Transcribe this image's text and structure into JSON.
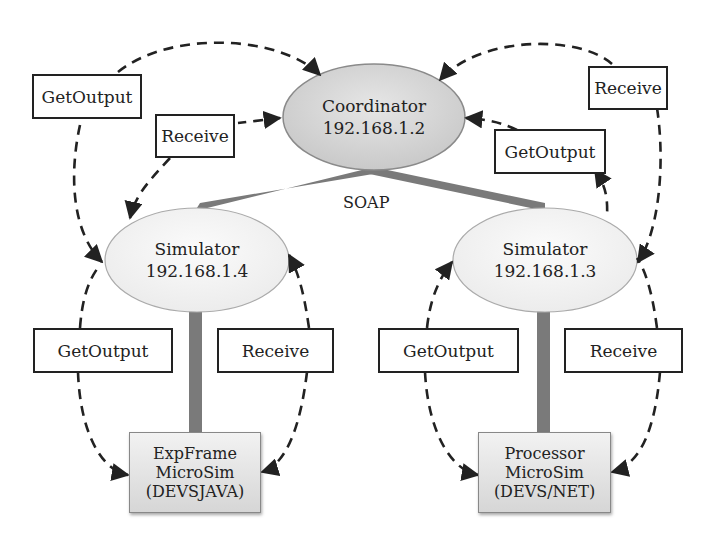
{
  "diagram": {
    "coordinator": {
      "name": "Coordinator",
      "ip": "192.168.1.2"
    },
    "protocol_label": "SOAP",
    "simulators": [
      {
        "name": "Simulator",
        "ip": "192.168.1.4"
      },
      {
        "name": "Simulator",
        "ip": "192.168.1.3"
      }
    ],
    "microsims": [
      {
        "line1": "ExpFrame",
        "line2": "MicroSim",
        "line3": "(DEVSJAVA)"
      },
      {
        "line1": "Processor",
        "line2": "MicroSim",
        "line3": "(DEVS/NET)"
      }
    ],
    "messages": {
      "top_left_outer": "GetOutput",
      "top_left_inner": "Receive",
      "top_right_outer": "Receive",
      "top_right_inner": "GetOutput",
      "left_sim_left": "GetOutput",
      "left_sim_right": "Receive",
      "right_sim_left": "GetOutput",
      "right_sim_right": "Receive"
    },
    "colors": {
      "node_fill": "#dcdcdc",
      "sim_fill": "#f0f0f0",
      "connector": "#7a7a7a",
      "arrow": "#222222"
    }
  }
}
